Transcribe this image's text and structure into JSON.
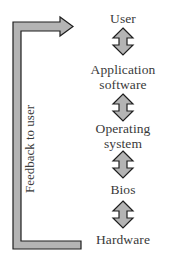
{
  "diagram": {
    "feedback_label": "Feedback to user",
    "nodes": [
      {
        "line1": "User",
        "line2": ""
      },
      {
        "line1": "Application",
        "line2": "software"
      },
      {
        "line1": "Operating",
        "line2": "system"
      },
      {
        "line1": "Bios",
        "line2": ""
      },
      {
        "line1": "Hardware",
        "line2": ""
      }
    ],
    "colors": {
      "arrow_fill": "#b4b4b4",
      "arrow_stroke": "#1e1e1e",
      "text": "#3a3a3a"
    }
  }
}
